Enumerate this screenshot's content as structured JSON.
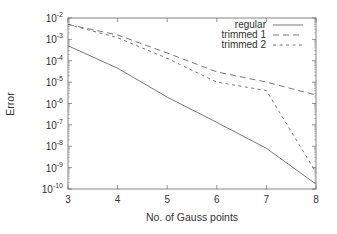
{
  "chart_data": {
    "type": "line",
    "title": "",
    "xlabel": "No. of Gauss points",
    "ylabel": "Error",
    "yscale": "log",
    "xlim": [
      3,
      8
    ],
    "ylim": [
      1e-10,
      0.01
    ],
    "xticks": [
      "3",
      "4",
      "5",
      "6",
      "7",
      "8"
    ],
    "yticks": [
      {
        "base": "10",
        "exp": "-2"
      },
      {
        "base": "10",
        "exp": "-3"
      },
      {
        "base": "10",
        "exp": "-4"
      },
      {
        "base": "10",
        "exp": "-5"
      },
      {
        "base": "10",
        "exp": "-6"
      },
      {
        "base": "10",
        "exp": "-7"
      },
      {
        "base": "10",
        "exp": "-8"
      },
      {
        "base": "10",
        "exp": "-9"
      },
      {
        "base": "10",
        "exp": "-10"
      }
    ],
    "grid": false,
    "legend_position": "upper right",
    "x": [
      3,
      4,
      5,
      6,
      7,
      8
    ],
    "series": [
      {
        "name": "regular",
        "style": "solid",
        "values": [
          0.0005,
          4.5e-05,
          2e-06,
          1.3e-07,
          8e-09,
          1.7e-10
        ]
      },
      {
        "name": "trimmed 1",
        "style": "long-dash",
        "values": [
          0.005,
          0.0016,
          0.00023,
          3e-05,
          1e-05,
          2.5e-06
        ]
      },
      {
        "name": "trimmed 2",
        "style": "short-dash",
        "values": [
          0.005,
          0.0012,
          0.00013,
          1e-05,
          4e-06,
          6e-10
        ]
      }
    ]
  },
  "legend": {
    "items": [
      {
        "label": "regular"
      },
      {
        "label": "trimmed 1"
      },
      {
        "label": "trimmed 2"
      }
    ]
  },
  "colors": {
    "axis": "#555555",
    "line": "#555555",
    "text": "#333333"
  }
}
